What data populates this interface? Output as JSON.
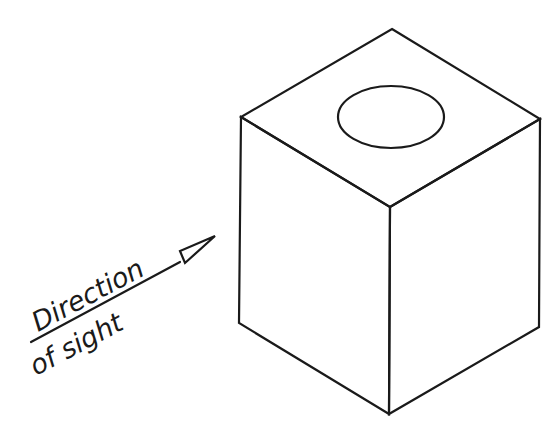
{
  "diagram": {
    "type": "isometric-view",
    "label": {
      "line1": "Direction",
      "line2": "of sight"
    },
    "colors": {
      "stroke": "#1a1a1a",
      "background": "#ffffff"
    }
  }
}
